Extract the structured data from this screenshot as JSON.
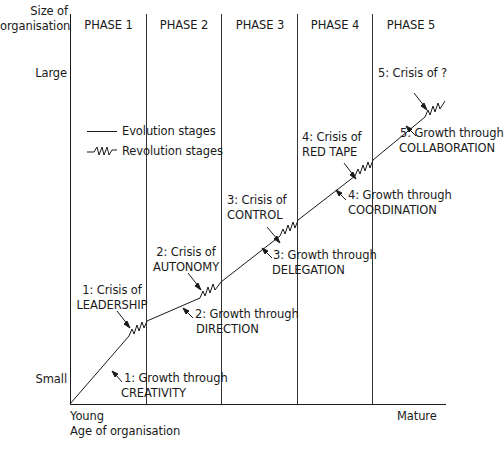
{
  "diagram": {
    "y_axis": {
      "title_line1": "Size of",
      "title_line2": "organisation",
      "large": "Large",
      "small": "Small"
    },
    "x_axis": {
      "young": "Young",
      "title": "Age of organisation",
      "mature": "Mature"
    },
    "phases": [
      "PHASE 1",
      "PHASE 2",
      "PHASE 3",
      "PHASE 4",
      "PHASE 5"
    ],
    "legend": {
      "evolution": "Evolution stages",
      "revolution": "Revolution stages"
    },
    "growth": [
      {
        "line1": "1: Growth through",
        "line2": "CREATIVITY"
      },
      {
        "line1": "2: Growth through",
        "line2": "DIRECTION"
      },
      {
        "line1": "3: Growth through",
        "line2": "DELEGATION"
      },
      {
        "line1": "4: Growth through",
        "line2": "COORDINATION"
      },
      {
        "line1": "5: Growth through",
        "line2": "COLLABORATION"
      }
    ],
    "crises": [
      {
        "line1": "1: Crisis of",
        "line2": "LEADERSHIP"
      },
      {
        "line1": "2: Crisis of",
        "line2": "AUTONOMY"
      },
      {
        "line1": "3: Crisis of",
        "line2": "CONTROL"
      },
      {
        "line1": "4: Crisis of",
        "line2": "RED TAPE"
      },
      {
        "line1": "5: Crisis of ?",
        "line2": ""
      }
    ],
    "colors": {
      "line": "#1a1a1a",
      "phase_divider": "#333333"
    }
  }
}
